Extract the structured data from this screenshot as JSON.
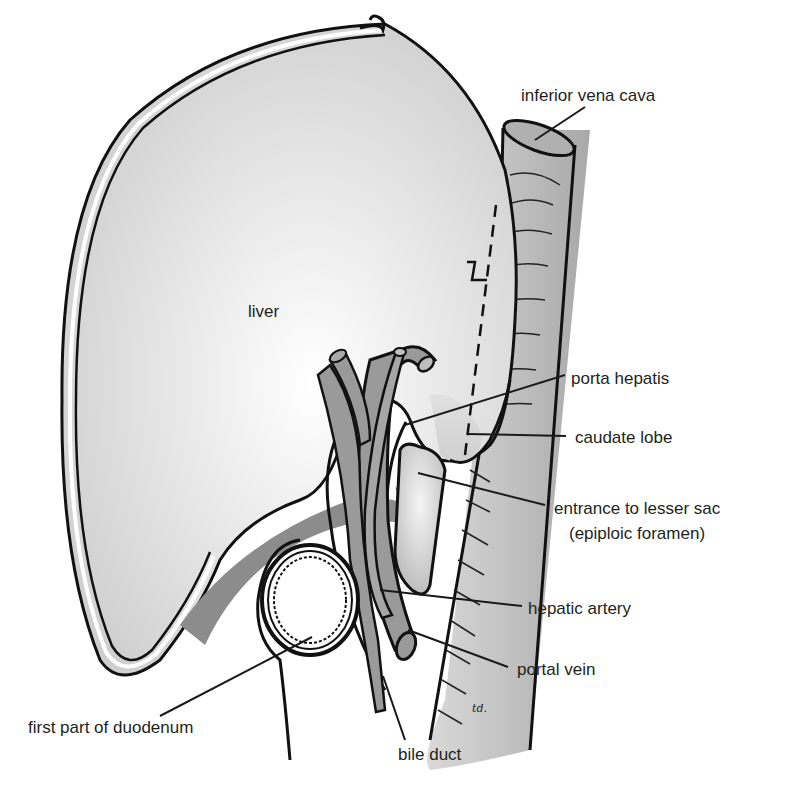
{
  "figure": {
    "type": "anatomical illustration",
    "colors": {
      "organ_fill_light": "#e4e4e4",
      "organ_fill_mid": "#c9c9c9",
      "vessel_fill": "#9a9a9a",
      "arrow_fill": "#8c8c8c",
      "outline": "#111111",
      "background": "#ffffff"
    },
    "signature": "td."
  },
  "labels": {
    "liver": "liver",
    "inferior_vena_cava": "inferior vena cava",
    "porta_hepatis": "porta hepatis",
    "caudate_lobe": "caudate lobe",
    "lesser_sac_line1": "entrance to lesser sac",
    "lesser_sac_line2": "(epiploic foramen)",
    "hepatic_artery": "hepatic artery",
    "portal_vein": "portal vein",
    "first_part_of_duodenum": "first part of duodenum",
    "bile_duct": "bile duct"
  }
}
